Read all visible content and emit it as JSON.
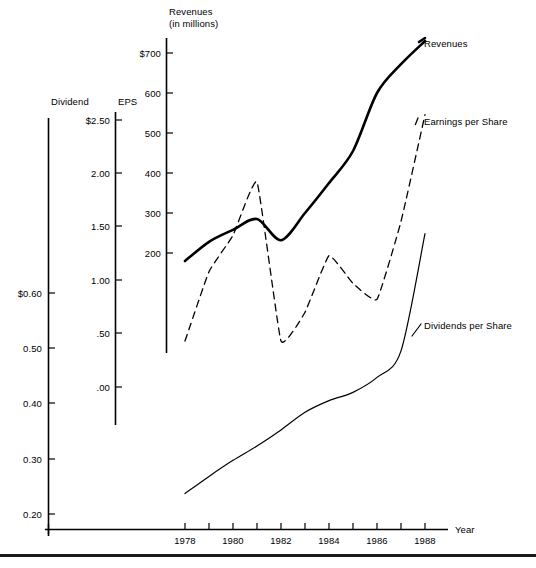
{
  "figure": {
    "background": "#ffffff",
    "ink": "#000000",
    "bottom_rule": true,
    "top_cutoff_artifact": ""
  },
  "axes": {
    "dividend": {
      "title": "Dividend",
      "ticks": [
        "$0.60",
        "0.50",
        "0.40",
        "0.30",
        "0.20"
      ],
      "tick_values": [
        0.6,
        0.5,
        0.4,
        0.3,
        0.2
      ]
    },
    "eps": {
      "title": "EPS",
      "ticks": [
        "$2.50",
        "2.00",
        "1.50",
        "1.00",
        ".50",
        ".00"
      ],
      "tick_values": [
        2.5,
        2.0,
        1.5,
        1.0,
        0.5,
        0.0
      ]
    },
    "revenues": {
      "title_line1": "Revenues",
      "title_line2": "(in millions)",
      "ticks": [
        "$700",
        "600",
        "500",
        "400",
        "300",
        "200"
      ],
      "tick_values": [
        700,
        600,
        500,
        400,
        300,
        200
      ]
    },
    "x": {
      "title": "Year",
      "ticks": [
        "1978",
        "1980",
        "1982",
        "1984",
        "1986",
        "1988"
      ],
      "tick_values": [
        1978,
        1980,
        1982,
        1984,
        1986,
        1988
      ],
      "minor_every": 1,
      "range": [
        1978,
        1988
      ]
    }
  },
  "series_labels": {
    "revenues": "Revenues",
    "eps": "Earnings per Share",
    "dividends": "Dividends per Share"
  },
  "chart_data": {
    "type": "line",
    "title": "",
    "subtitle": "",
    "xlabel": "Year",
    "ylabel": "",
    "grid": false,
    "legend": "right-inline",
    "x": [
      1978,
      1979,
      1980,
      1981,
      1982,
      1983,
      1984,
      1985,
      1986,
      1987,
      1988
    ],
    "axis_ranges": {
      "revenues": [
        0,
        700
      ],
      "eps": [
        0.0,
        2.5
      ],
      "dividend": [
        0.1,
        0.6
      ],
      "year": [
        1978,
        1988
      ]
    },
    "series": [
      {
        "name": "Revenues",
        "label": "Revenues",
        "axis": "revenues",
        "units": "millions of dollars",
        "style": "solid-thick",
        "values": [
          180,
          228,
          258,
          285,
          232,
          300,
          375,
          455,
          600,
          672,
          730
        ]
      },
      {
        "name": "Earnings per Share",
        "label": "Earnings per Share",
        "axis": "eps",
        "units": "dollars per share",
        "style": "dashed",
        "values": [
          0.43,
          1.08,
          1.42,
          1.92,
          0.43,
          0.7,
          1.23,
          0.97,
          0.82,
          1.55,
          2.55
        ]
      },
      {
        "name": "Dividends per Share",
        "label": "Dividends per Share",
        "axis": "dividend",
        "units": "dollars per share",
        "style": "solid-thin",
        "values": [
          0.237,
          0.268,
          0.297,
          0.323,
          0.352,
          0.384,
          0.405,
          0.42,
          0.447,
          0.495,
          0.707
        ]
      }
    ]
  }
}
